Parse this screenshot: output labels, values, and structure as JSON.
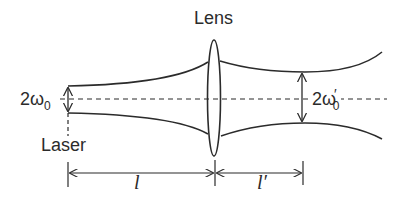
{
  "diagram": {
    "labels": {
      "lens": "Lens",
      "laser": "Laser",
      "waist_input_prefix": "2ω",
      "waist_input_sub": "0",
      "waist_output_prefix": "2ω",
      "waist_output_prime": "′",
      "waist_output_sub": "0",
      "distance_before_lens": "l",
      "distance_after_lens": "l′"
    },
    "colors": {
      "stroke": "#2b2b2b",
      "background": "#ffffff"
    },
    "elements": [
      "laser source with input beam waist 2ω0",
      "expanding beam from laser to lens",
      "thin convex lens",
      "converging beam to output waist 2ω′0",
      "optical axis (dashed)",
      "dimension arrow l (laser to lens)",
      "dimension arrow l′ (lens to output waist)"
    ]
  }
}
